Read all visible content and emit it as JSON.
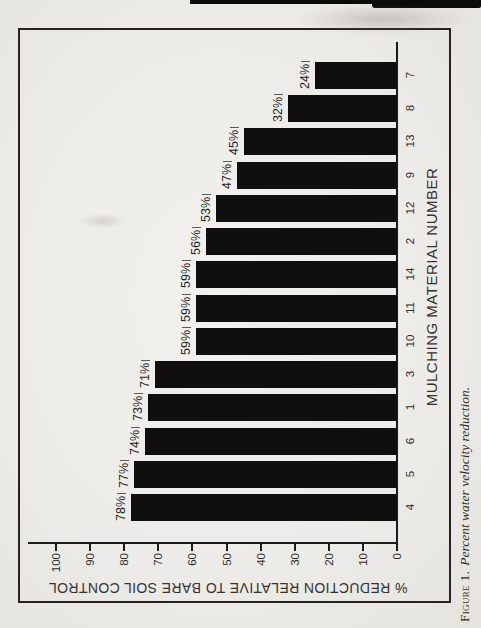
{
  "figure_caption": {
    "label": "Figure 1.",
    "text": "Percent water velocity reduction."
  },
  "chart_data": {
    "type": "bar",
    "title": "",
    "categories": [
      "4",
      "5",
      "6",
      "1",
      "3",
      "10",
      "11",
      "14",
      "2",
      "12",
      "9",
      "13",
      "8",
      "7"
    ],
    "values": [
      78,
      77,
      74,
      73,
      71,
      59,
      59,
      59,
      56,
      53,
      47,
      45,
      32,
      24
    ],
    "bar_labels": [
      "78%",
      "77%",
      "74%",
      "73%",
      "71%",
      "59%",
      "59%",
      "59%",
      "56%",
      "53%",
      "47%",
      "45%",
      "32%",
      "24%"
    ],
    "xlabel": "MULCHING MATERIAL NUMBER",
    "ylabel": "% REDUCTION RELATIVE TO BARE SOIL CONTROL",
    "ylim": [
      0,
      100
    ],
    "yticks": [
      0,
      10,
      20,
      30,
      40,
      50,
      60,
      70,
      80,
      90,
      100
    ],
    "grid": "off",
    "legend": "none",
    "bar_color": "#100f0e",
    "layout": {
      "orientation": "vertical bars, entire figure rotated 90 degrees counterclockwise on the page",
      "value_labels": "above bars"
    }
  }
}
